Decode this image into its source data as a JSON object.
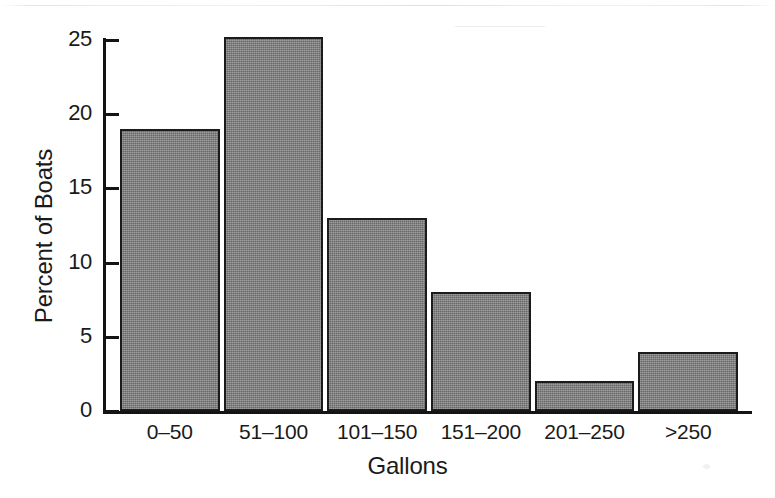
{
  "chart_data": {
    "type": "bar",
    "title": "",
    "xlabel": "Gallons",
    "ylabel": "Percent of Boats",
    "categories": [
      "0–50",
      "51–100",
      "101–150",
      "151–200",
      "201–250",
      ">250"
    ],
    "values": [
      19,
      25.2,
      13,
      8,
      2,
      4
    ],
    "ylim": [
      0,
      25.2
    ],
    "yticks": [
      0,
      5,
      10,
      15,
      20,
      25
    ],
    "ytick_labels": [
      "0",
      "5",
      "10",
      "15",
      "20",
      "25"
    ],
    "grid": false,
    "legend": false,
    "series": [
      {
        "name": "Percent of Boats",
        "values": [
          19,
          25.2,
          13,
          8,
          2,
          4
        ]
      }
    ],
    "bar_fill_color": "#808080",
    "bar_edge_color": "#1b1b1b",
    "background_color": "#ffffff",
    "axis_color": "#141414"
  }
}
